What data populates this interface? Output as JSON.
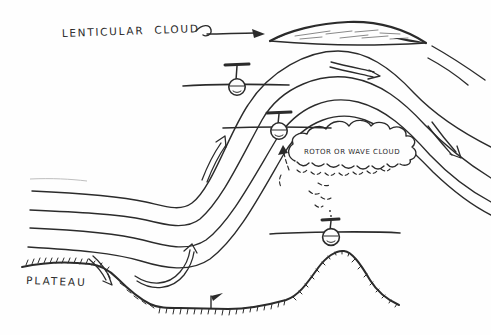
{
  "labels": {
    "lenticular_cloud": "LENTICULAR CLOUD",
    "rotor_cloud": "ROTOR OR WAVE CLOUD",
    "plateau": "PLATEAU"
  },
  "colors": {
    "ink": "#2b2b2b",
    "paper": "#fefefe",
    "faint": "#bfbfbf"
  },
  "diagram": {
    "type": "hand-drawn mountain lee-wave sketch",
    "streamline_count": 4,
    "gliders": [
      {
        "name": "glider-upper",
        "x": 237,
        "y": 87
      },
      {
        "name": "glider-middle",
        "x": 279,
        "y": 131
      },
      {
        "name": "glider-lower",
        "x": 331,
        "y": 237
      }
    ],
    "arrows": [
      "label-leader-arrow",
      "downslope-arrow",
      "valley-upswing-arrow",
      "windward-climb-arrow",
      "crest-flow-arrow",
      "lee-descent-arrow",
      "rotor-updraft-arrow"
    ],
    "terrain": [
      "plateau",
      "valley-floor",
      "hill",
      "wind-flag"
    ]
  }
}
